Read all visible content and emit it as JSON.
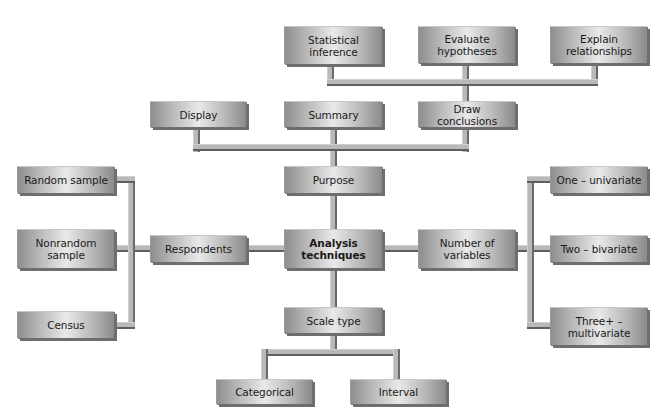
{
  "diagram": {
    "center": {
      "label": "Analysis techniques",
      "line1": "Analysis",
      "line2": "techniques"
    },
    "purpose": {
      "label": "Purpose",
      "children": {
        "display": "Display",
        "summary": "Summary",
        "draw_conclusions": "Draw conclusions"
      },
      "conclusions_children": {
        "statistical_inference": {
          "line1": "Statistical",
          "line2": "inference"
        },
        "evaluate_hypotheses": {
          "line1": "Evaluate",
          "line2": "hypotheses"
        },
        "explain_relationships": {
          "line1": "Explain",
          "line2": "relationships"
        }
      }
    },
    "respondents": {
      "label": "Respondents",
      "children": {
        "random_sample": "Random sample",
        "nonrandom_sample": {
          "line1": "Nonrandom",
          "line2": "sample"
        },
        "census": "Census"
      }
    },
    "number_of_variables": {
      "line1": "Number of",
      "line2": "variables",
      "children": {
        "one": "One – univariate",
        "two": "Two – bivariate",
        "three": {
          "line1": "Three+ –",
          "line2": "multivariate"
        }
      }
    },
    "scale_type": {
      "label": "Scale type",
      "children": {
        "categorical": "Categorical",
        "interval": "Interval"
      }
    }
  }
}
